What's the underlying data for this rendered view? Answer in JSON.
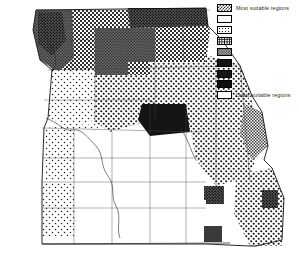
{
  "figure": {
    "type": "choropleth-map",
    "background_color": "#ffffff",
    "outline_color": "#000000"
  },
  "legend": {
    "title_top": "Most suitable regions",
    "title_bottom": "Least suitable regions",
    "orientation": "vertical",
    "position": "top-right",
    "items": [
      {
        "rank": 1,
        "pattern": "coarse-checker-dark",
        "label": "Most suitable regions",
        "label_visible": true,
        "fill": "#4a4a4a"
      },
      {
        "rank": 2,
        "pattern": "solid-white",
        "label": "",
        "label_visible": false,
        "fill": "#ffffff"
      },
      {
        "rank": 3,
        "pattern": "sparse-dots",
        "label": "",
        "label_visible": false,
        "fill": "#ffffff"
      },
      {
        "rank": 4,
        "pattern": "cross-hatch",
        "label": "",
        "label_visible": false,
        "fill": "#ffffff"
      },
      {
        "rank": 5,
        "pattern": "fine-checker",
        "label": "",
        "label_visible": false,
        "fill": "#8a8a8a"
      },
      {
        "rank": 6,
        "pattern": "dense-stipple",
        "label": "",
        "label_visible": false,
        "fill": "#6e6e6e"
      },
      {
        "rank": 7,
        "pattern": "solid-black",
        "label": "",
        "label_visible": false,
        "fill": "#141414"
      },
      {
        "rank": 8,
        "pattern": "solid-black",
        "label": "",
        "label_visible": false,
        "fill": "#101010"
      },
      {
        "rank": 9,
        "pattern": "solid-white-outline",
        "label": "Least suitable regions",
        "label_visible": true,
        "fill": "#ffffff"
      }
    ]
  },
  "map_data": {
    "type": "map",
    "state": "Missouri",
    "classes": [
      "coarse-checker-dark",
      "solid-white",
      "sparse-dots",
      "cross-hatch",
      "fine-checker",
      "dense-stipple",
      "solid-black",
      "blank"
    ],
    "regions": [
      {
        "name": "northwest-corner-dark",
        "class": "dense-stipple"
      },
      {
        "name": "north-central-checker",
        "class": "cross-hatch"
      },
      {
        "name": "northeast-dark-band",
        "class": "dense-stipple"
      },
      {
        "name": "north-center-block",
        "class": "fine-checker"
      },
      {
        "name": "west-central-dots",
        "class": "sparse-dots"
      },
      {
        "name": "central-blank",
        "class": "solid-white"
      },
      {
        "name": "east-central-checker",
        "class": "cross-hatch"
      },
      {
        "name": "southeast-bootheel",
        "class": "cross-hatch"
      },
      {
        "name": "south-central-black",
        "class": "solid-black"
      },
      {
        "name": "southwest-blank",
        "class": "blank"
      }
    ]
  }
}
